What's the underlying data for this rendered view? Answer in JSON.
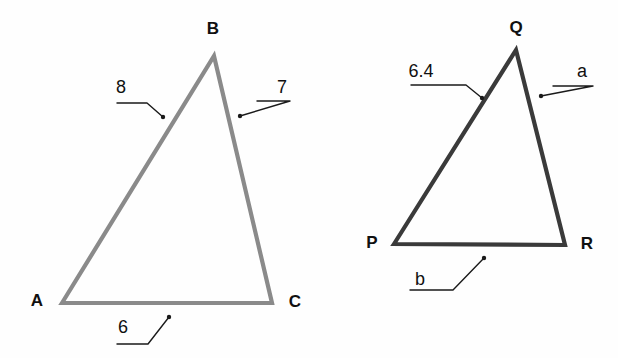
{
  "figure": {
    "background_color": "#fefefe",
    "label_color": "#101010",
    "leader_color": "#1a1a1a",
    "triangles": [
      {
        "name": "triangle-abc",
        "stroke_color": "#8a8a8a",
        "stroke_width": 4.2,
        "vertices": [
          {
            "name": "A",
            "label": "A",
            "x": 62,
            "y": 303,
            "label_x": 37,
            "label_y": 300
          },
          {
            "name": "B",
            "label": "B",
            "x": 214,
            "y": 56,
            "label_x": 213,
            "label_y": 28
          },
          {
            "name": "C",
            "label": "C",
            "x": 272,
            "y": 303,
            "label_x": 295,
            "label_y": 301
          }
        ],
        "side_labels": [
          {
            "name": "side-ab-length",
            "label": "8",
            "label_x": 121,
            "label_y": 87,
            "leader": {
              "hx1": 117,
              "hx2": 147,
              "hy": 103,
              "dx": 163,
              "dy": 117
            }
          },
          {
            "name": "side-bc-length",
            "label": "7",
            "label_x": 282,
            "label_y": 87,
            "leader": {
              "hx1": 257,
              "hx2": 290,
              "hy": 101,
              "dx": 240,
              "dy": 116
            }
          },
          {
            "name": "side-ac-length",
            "label": "6",
            "label_x": 123,
            "label_y": 327,
            "leader": {
              "hx1": 117,
              "hx2": 148,
              "hy": 344,
              "dx": 169,
              "dy": 317
            }
          }
        ]
      },
      {
        "name": "triangle-pqr",
        "stroke_color": "#3a3a3a",
        "stroke_width": 4.2,
        "vertices": [
          {
            "name": "P",
            "label": "P",
            "x": 394,
            "y": 244,
            "label_x": 372,
            "label_y": 242
          },
          {
            "name": "Q",
            "label": "Q",
            "x": 516,
            "y": 50,
            "label_x": 516,
            "label_y": 27
          },
          {
            "name": "R",
            "label": "R",
            "x": 565,
            "y": 245,
            "label_x": 587,
            "label_y": 243
          }
        ],
        "side_labels": [
          {
            "name": "side-pq-length",
            "label": "6.4",
            "label_x": 421,
            "label_y": 71,
            "leader": {
              "hx1": 411,
              "hx2": 466,
              "hy": 85,
              "dx": 482,
              "dy": 98
            }
          },
          {
            "name": "side-qr-length",
            "label": "a",
            "label_x": 582,
            "label_y": 71,
            "leader": {
              "hx1": 553,
              "hx2": 593,
              "hy": 86,
              "dx": 541,
              "dy": 96
            }
          },
          {
            "name": "side-pr-length",
            "label": "b",
            "label_x": 420,
            "label_y": 279,
            "leader": {
              "hx1": 410,
              "hx2": 453,
              "hy": 290,
              "dx": 484,
              "dy": 258
            }
          }
        ]
      }
    ]
  }
}
